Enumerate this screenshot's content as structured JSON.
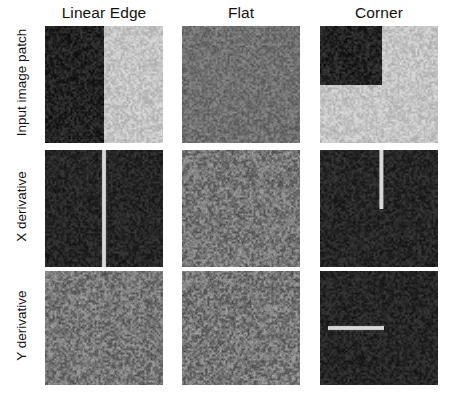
{
  "figure": {
    "title": "",
    "background_color": "#ffffff",
    "width": 461,
    "height": 400
  },
  "columns": [
    {
      "key": "linear_edge",
      "label": "Linear Edge",
      "x": 45,
      "width": 118
    },
    {
      "key": "flat",
      "label": "Flat",
      "x": 182,
      "width": 118
    },
    {
      "key": "corner",
      "label": "Corner",
      "x": 320,
      "width": 118
    }
  ],
  "rows": [
    {
      "key": "input",
      "label": "Input image patch",
      "y": 26,
      "height": 117
    },
    {
      "key": "x_deriv",
      "label": "X derivative",
      "y": 150,
      "height": 117
    },
    {
      "key": "y_deriv",
      "label": "Y derivative",
      "y": 271,
      "height": 114
    }
  ],
  "panels": [
    {
      "id": "input-linear-edge",
      "row": "input",
      "column": "linear_edge",
      "name": "panel-input-linear-edge",
      "pattern": "vertical-step",
      "dark_value": 34,
      "light_value": 196,
      "edge_fraction": 0.5,
      "noise_amplitude": 26
    },
    {
      "id": "input-flat",
      "row": "input",
      "column": "flat",
      "name": "panel-input-flat",
      "pattern": "uniform",
      "base_value": 112,
      "noise_amplitude": 30
    },
    {
      "id": "input-corner",
      "row": "input",
      "column": "corner",
      "name": "panel-input-corner",
      "pattern": "corner-step",
      "dark_value": 34,
      "light_value": 196,
      "corner_x_fraction": 0.52,
      "corner_y_fraction": 0.5,
      "noise_amplitude": 26
    },
    {
      "id": "xderiv-linear-edge",
      "row": "x_deriv",
      "column": "linear_edge",
      "name": "panel-xderivative-linear-edge",
      "pattern": "dark-with-vertical-line",
      "base_value": 38,
      "line_value": 215,
      "line_x_fraction": 0.5,
      "line_y_start_fraction": 0.0,
      "line_y_end_fraction": 1.0,
      "line_width_px": 2,
      "noise_amplitude": 22
    },
    {
      "id": "xderiv-flat",
      "row": "x_deriv",
      "column": "flat",
      "name": "panel-xderivative-flat",
      "pattern": "uniform",
      "base_value": 118,
      "noise_amplitude": 44
    },
    {
      "id": "xderiv-corner",
      "row": "x_deriv",
      "column": "corner",
      "name": "panel-xderivative-corner",
      "pattern": "dark-with-vertical-line",
      "base_value": 38,
      "line_value": 215,
      "line_x_fraction": 0.52,
      "line_y_start_fraction": 0.0,
      "line_y_end_fraction": 0.5,
      "line_width_px": 2,
      "noise_amplitude": 22
    },
    {
      "id": "yderiv-linear-edge",
      "row": "y_deriv",
      "column": "linear_edge",
      "name": "panel-yderivative-linear-edge",
      "pattern": "uniform",
      "base_value": 118,
      "noise_amplitude": 44
    },
    {
      "id": "yderiv-flat",
      "row": "y_deriv",
      "column": "flat",
      "name": "panel-yderivative-flat",
      "pattern": "uniform",
      "base_value": 118,
      "noise_amplitude": 46
    },
    {
      "id": "yderiv-corner",
      "row": "y_deriv",
      "column": "corner",
      "name": "panel-yderivative-corner",
      "pattern": "dark-with-horizontal-line",
      "base_value": 38,
      "line_value": 215,
      "line_y_fraction": 0.5,
      "line_x_start_fraction": 0.06,
      "line_x_end_fraction": 0.54,
      "line_width_px": 2,
      "noise_amplitude": 22
    }
  ],
  "chart_data": {
    "type": "heatmap",
    "title": "",
    "xlabel": "",
    "ylabel": "",
    "grid_layout": "3 columns x 3 rows",
    "column_labels": [
      "Linear Edge",
      "Flat",
      "Corner"
    ],
    "row_labels": [
      "Input image patch",
      "X derivative",
      "Y derivative"
    ],
    "cells": [
      {
        "row": "Input image patch",
        "column": "Linear Edge",
        "description": "Noisy patch split vertically: dark left half, bright right half",
        "mean_intensity_left": 34,
        "mean_intensity_right": 196,
        "edge_orientation": "vertical",
        "edge_position_fraction": 0.5
      },
      {
        "row": "Input image patch",
        "column": "Flat",
        "description": "Uniform mid-gray noisy patch, no structure",
        "mean_intensity": 112
      },
      {
        "row": "Input image patch",
        "column": "Corner",
        "description": "Bright noisy patch with dark square occupying the upper-left quadrant",
        "mean_intensity_dark_region": 34,
        "mean_intensity_bright_region": 196,
        "corner_position_fraction_x": 0.52,
        "corner_position_fraction_y": 0.5
      },
      {
        "row": "X derivative",
        "column": "Linear Edge",
        "description": "Near-zero (dark) response with a single bright vertical line spanning the full height at the edge location",
        "response_baseline": 38,
        "response_peak": 215,
        "peak_geometry": "full-height vertical line at x = 0.50"
      },
      {
        "row": "X derivative",
        "column": "Flat",
        "description": "Uniform mid-gray noise, no coherent response",
        "response_baseline": 118
      },
      {
        "row": "X derivative",
        "column": "Corner",
        "description": "Near-zero (dark) response with a bright vertical line spanning only the top half at the vertical corner edge",
        "response_baseline": 38,
        "response_peak": 215,
        "peak_geometry": "half-height vertical line at x = 0.52, y from 0.00 to 0.50"
      },
      {
        "row": "Y derivative",
        "column": "Linear Edge",
        "description": "Uniform mid-gray noise, no coherent response (edge is vertical, so no y-gradient)",
        "response_baseline": 118
      },
      {
        "row": "Y derivative",
        "column": "Flat",
        "description": "Uniform mid-gray noise, no coherent response",
        "response_baseline": 118
      },
      {
        "row": "Y derivative",
        "column": "Corner",
        "description": "Near-zero (dark) response with a bright horizontal line spanning the left portion at the horizontal corner edge",
        "response_baseline": 38,
        "response_peak": 215,
        "peak_geometry": "horizontal line at y = 0.50, x from 0.06 to 0.54"
      }
    ]
  }
}
